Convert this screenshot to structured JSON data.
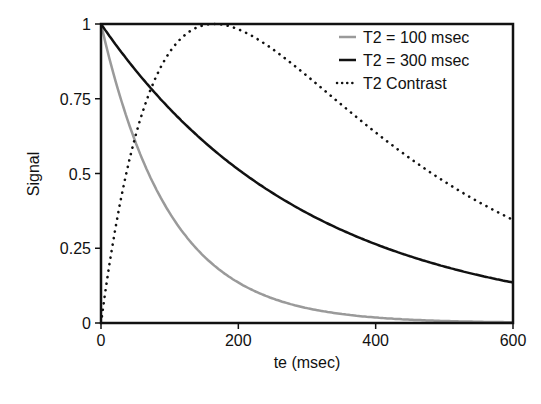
{
  "chart_data": {
    "type": "line",
    "title": "",
    "xlabel": "te (msec)",
    "ylabel": "Signal",
    "xlim": [
      0,
      600
    ],
    "ylim": [
      0,
      1
    ],
    "x_ticks": [
      "0",
      "200",
      "400",
      "600"
    ],
    "y_ticks": [
      "0",
      "0.25",
      "0.5",
      "0.75",
      "1"
    ],
    "grid": false,
    "legend_position": "upper right",
    "series": [
      {
        "name": "T2 = 100 msec",
        "style": "solid",
        "color": "#9a9a9a",
        "formula": "exp(-te/100)",
        "x": [
          0,
          50,
          100,
          150,
          200,
          300,
          400,
          500,
          600
        ],
        "values": [
          1.0,
          0.61,
          0.37,
          0.22,
          0.14,
          0.05,
          0.02,
          0.01,
          0.0
        ]
      },
      {
        "name": "T2 = 300 msec",
        "style": "solid",
        "color": "#111111",
        "formula": "exp(-te/300)",
        "x": [
          0,
          50,
          100,
          150,
          200,
          300,
          400,
          500,
          600
        ],
        "values": [
          1.0,
          0.85,
          0.72,
          0.61,
          0.51,
          0.37,
          0.26,
          0.19,
          0.14
        ]
      },
      {
        "name": "T2 Contrast",
        "style": "dotted",
        "color": "#111111",
        "formula": "normalized exp(-te/300)-exp(-te/100)",
        "x": [
          0,
          50,
          100,
          150,
          165,
          200,
          300,
          400,
          500,
          600
        ],
        "values": [
          0.0,
          0.62,
          0.91,
          0.99,
          1.0,
          0.98,
          0.8,
          0.6,
          0.47,
          0.35
        ]
      }
    ]
  }
}
